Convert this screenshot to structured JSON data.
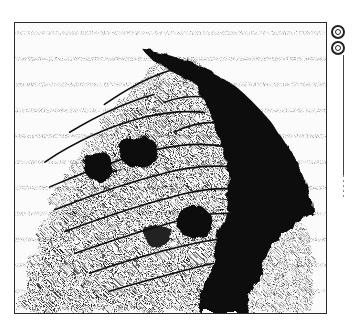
{
  "viewer": {
    "type": "scanned-halftone-map",
    "frame_color": "#2a2a2a",
    "ink_color": "#111111",
    "paper_color": "#fbfbfb"
  },
  "controls": {
    "buttons": [
      {
        "id": "ring-button-1",
        "icon": "double-ring-icon"
      },
      {
        "id": "ring-button-2",
        "icon": "double-ring-icon"
      }
    ],
    "scroll_track": {
      "orientation": "vertical"
    }
  }
}
